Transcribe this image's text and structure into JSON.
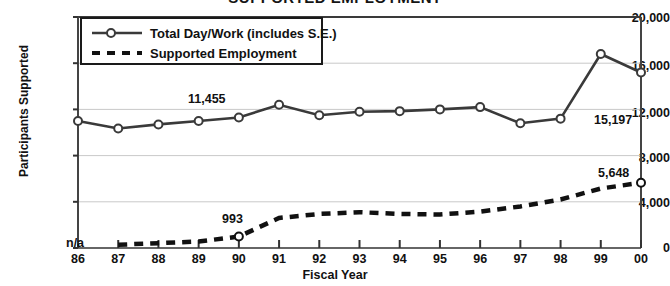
{
  "chart_data": {
    "type": "line",
    "title": "SUPPORTED EMPLOYMENT",
    "xlabel": "Fiscal Year",
    "ylabel": "Participants Supported",
    "categories": [
      "86",
      "87",
      "88",
      "89",
      "90",
      "91",
      "92",
      "93",
      "94",
      "95",
      "96",
      "97",
      "98",
      "99",
      "00"
    ],
    "ylim": [
      0,
      20000
    ],
    "ytick_labels": [
      "0",
      "4,000",
      "8,000",
      "12,000",
      "16,000",
      "20,000"
    ],
    "ytick_values": [
      0,
      4000,
      8000,
      12000,
      16000,
      20000
    ],
    "grid": true,
    "legend_position": "upper-left-inside",
    "series": [
      {
        "name": "Total Day/Work (includes S.E.)",
        "style": "solid-with-markers",
        "values": [
          11000,
          10350,
          10700,
          11000,
          11300,
          12400,
          11500,
          11800,
          11850,
          12000,
          12200,
          10800,
          11200,
          16800,
          15197
        ]
      },
      {
        "name": "Supported Employment",
        "style": "dashed",
        "values": [
          null,
          280,
          420,
          560,
          993,
          2600,
          2950,
          3100,
          2950,
          2900,
          3150,
          3600,
          4200,
          5150,
          5648
        ]
      }
    ],
    "annotations": [
      {
        "text": "11,455",
        "series": "Total Day/Work (includes S.E.)",
        "category": "91",
        "position": "above-left"
      },
      {
        "text": "15,197",
        "series": "Total Day/Work (includes S.E.)",
        "category": "00",
        "position": "below-left"
      },
      {
        "text": "993",
        "series": "Supported Employment",
        "category": "90",
        "position": "above"
      },
      {
        "text": "5,648",
        "series": "Supported Employment",
        "category": "00",
        "position": "above-left"
      },
      {
        "text": "n/a",
        "series": "Supported Employment",
        "category": "86",
        "position": "at-axis"
      }
    ]
  },
  "legend": {
    "items": [
      {
        "label": "Total Day/Work (includes S.E.)",
        "marker": "line-circle-marker"
      },
      {
        "label": "Supported Employment",
        "marker": "dashed-line"
      }
    ]
  },
  "colors": {
    "line": "#3a3a3a",
    "dashed": "#111111",
    "grid": "#c9c9c9",
    "axis": "#555555",
    "text": "#111111"
  }
}
